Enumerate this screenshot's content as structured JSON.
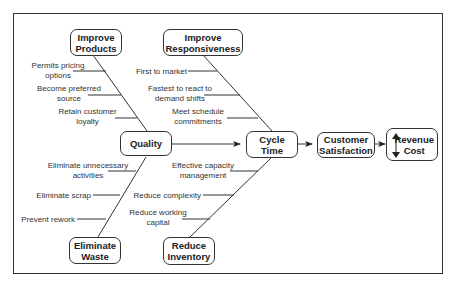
{
  "diagram": {
    "type": "fishbone-flow",
    "nodes": {
      "improve_products": "Improve\nProducts",
      "improve_responsiveness": "Improve\nResponsiveness",
      "quality": "Quality",
      "cycle_time": "Cycle\nTime",
      "customer_satisfaction": "Customer\nSatisfaction",
      "revenue_cost": "Revenue\nCost",
      "eliminate_waste": "Eliminate\nWaste",
      "reduce_inventory": "Reduce\nInventory"
    },
    "branches": {
      "improve_products": [
        "Permits pricing\noptions",
        "Become preferred\nsource",
        "Retain customer\nloyalty"
      ],
      "improve_responsiveness": [
        "First to market",
        "Fastest to react to\ndemand shifts",
        "Meet schedule\ncommitments"
      ],
      "eliminate_waste": [
        "Eliminate unnecessary\nactivities",
        "Eliminate scrap",
        "Prevent rework"
      ],
      "reduce_inventory": [
        "Effective capacity\nmanagement",
        "Reduce complexity",
        "Reduce working\ncapital"
      ]
    },
    "flow": [
      "Quality",
      "Cycle Time",
      "Customer Satisfaction",
      "Revenue Cost"
    ],
    "icons": {
      "revenue_cost": "up-down-arrow-icon"
    }
  }
}
